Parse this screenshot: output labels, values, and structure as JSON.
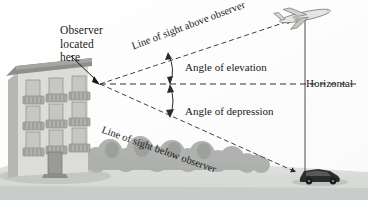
{
  "figure": {
    "type": "geometry-diagram",
    "topic": "angle-of-elevation-and-depression",
    "background_color": "#ffffff"
  },
  "labels": {
    "observer_line1": "Observer",
    "observer_line2": "located",
    "observer_line3": "here",
    "line_of_sight_above": "Line of sight above observer",
    "line_of_sight_below": "Line of sight below observer",
    "angle_of_elevation": "Angle of elevation",
    "angle_of_depression": "Angle of depression",
    "horizontal": "Horizontal"
  },
  "objects": {
    "building": "apartment-building",
    "airplane": "airplane",
    "car": "car",
    "trees": "tree-line",
    "ground": "ground-plane"
  },
  "colors": {
    "ink": "#1a1a1a",
    "line": "#3a3a3a",
    "building_face": "#d9d9d6",
    "building_side": "#b9b9b6",
    "roof": "#8f8f8c",
    "tree": "#a8aba8",
    "ground": "#cfd2cf",
    "car": "#2b2b2b",
    "plane": "#e2e2e0"
  },
  "geometry": {
    "observer_x": 100,
    "observer_y": 84,
    "target_x": 305,
    "plane_y": 16,
    "car_y": 178,
    "horizontal_y": 84
  }
}
